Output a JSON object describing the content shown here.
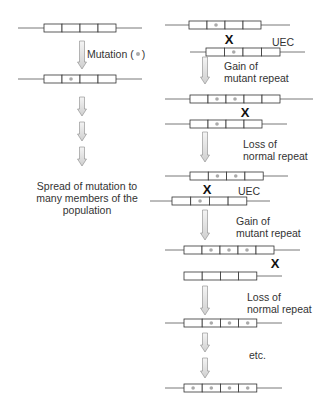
{
  "left": {
    "mutation_label": "Mutation (",
    "mutation_label_end": ")",
    "spread_label_lines": [
      "Spread of mutation to",
      "many members of the",
      "population"
    ]
  },
  "right": {
    "uec_1": "UEC",
    "gain_1_line1": "Gain of",
    "gain_1_line2": "mutant repeat",
    "loss_1_line1": "Loss of",
    "loss_1_line2": "normal repeat",
    "uec_2": "UEC",
    "gain_2_line1": "Gain of",
    "gain_2_line2": "mutant repeat",
    "loss_2_line1": "Loss of",
    "loss_2_line2": "normal repeat",
    "etc": "etc."
  },
  "crossover_mark": "X",
  "colors": {
    "line": "#555555",
    "box_border": "#333333",
    "dot": "#aaaaaa",
    "arrow_fill": "#e6e6e6",
    "arrow_stroke": "#888888"
  },
  "rows": [
    {
      "id": "L1",
      "y": 28,
      "line": [
        18,
        142
      ],
      "box_x": 44,
      "cells": 4,
      "cell_w": 18,
      "dots": []
    },
    {
      "id": "L2",
      "y": 79,
      "line": [
        18,
        142
      ],
      "box_x": 44,
      "cells": 4,
      "cell_w": 18,
      "dots": [
        2
      ]
    },
    {
      "id": "R1",
      "y": 25,
      "line": [
        165,
        290
      ],
      "box_x": 189,
      "cells": 4,
      "cell_w": 18,
      "dots": [
        2
      ]
    },
    {
      "id": "R2",
      "y": 52,
      "line": [
        190,
        305
      ],
      "box_x": 206,
      "cells": 4,
      "cell_w": 18.5,
      "dots": [
        2
      ]
    },
    {
      "id": "R3",
      "y": 99,
      "line": [
        165,
        313
      ],
      "box_x": 190,
      "cells": 5,
      "cell_w": 18,
      "dots": [
        2,
        3
      ]
    },
    {
      "id": "R4",
      "y": 124,
      "line": [
        165,
        287
      ],
      "box_x": 190,
      "cells": 4,
      "cell_w": 18,
      "dots": [
        2
      ]
    },
    {
      "id": "R5",
      "y": 176,
      "line": [
        165,
        288
      ],
      "box_x": 190,
      "cells": 4,
      "cell_w": 18.3,
      "dots": [
        2,
        3
      ]
    },
    {
      "id": "R6",
      "y": 201,
      "line": [
        150,
        270
      ],
      "box_x": 172,
      "cells": 4,
      "cell_w": 18.7,
      "dots": [
        2
      ]
    },
    {
      "id": "R7",
      "y": 250,
      "line": [
        165,
        300
      ],
      "box_x": 184,
      "cells": 5,
      "cell_w": 18,
      "dots": [
        2,
        3,
        4
      ]
    },
    {
      "id": "R8",
      "y": 276,
      "line": [
        184,
        282
      ],
      "box_x": 184,
      "cells": 4,
      "cell_w": 18.2,
      "dots": []
    },
    {
      "id": "R9",
      "y": 323,
      "line": [
        165,
        282
      ],
      "box_x": 184,
      "cells": 4,
      "cell_w": 18.2,
      "dots": [
        2,
        3,
        4
      ]
    },
    {
      "id": "R10",
      "y": 388,
      "line": [
        165,
        282
      ],
      "box_x": 184,
      "cells": 4,
      "cell_w": 18.2,
      "dots": [
        1,
        2,
        3,
        4
      ]
    }
  ]
}
